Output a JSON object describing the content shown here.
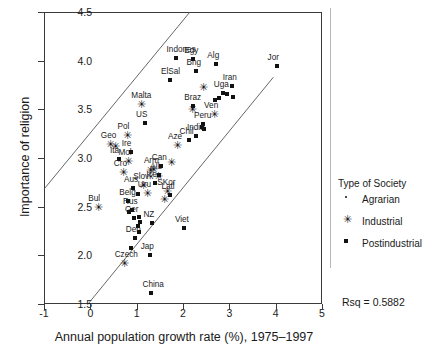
{
  "chart_data": {
    "type": "scatter",
    "title": "",
    "xlabel": "Annual population growth rate (%), 1975–1997",
    "ylabel": "Importance of religion",
    "xlim": [
      -1,
      5
    ],
    "ylim": [
      1.5,
      4.5
    ],
    "xticks": [
      "-1",
      "0",
      "1",
      "2",
      "3",
      "4",
      "5"
    ],
    "yticks": [
      "1.5",
      "2.0",
      "2.5",
      "3.0",
      "3.5",
      "4.0",
      "4.5"
    ],
    "grid": false,
    "annotation": "Rsq = 0.5882",
    "legend": {
      "title": "Type of Society",
      "position": "right",
      "entries": [
        {
          "label": "Agrarian",
          "marker": "dot"
        },
        {
          "label": "Industrial",
          "marker": "asterisk"
        },
        {
          "label": "Postindustrial",
          "marker": "square"
        }
      ]
    },
    "reference_lines": [
      {
        "name": "upper-band",
        "x0": -1,
        "y0": 2.68,
        "x1": 2.15,
        "y1": 4.5
      },
      {
        "name": "lower-band",
        "x0": -0.05,
        "y0": 1.5,
        "x1": 3.95,
        "y1": 3.83
      }
    ],
    "points": [
      {
        "label": "Indones",
        "x": 1.84,
        "y": 4.03,
        "marker": "square"
      },
      {
        "label": "Egy",
        "x": 2.22,
        "y": 4.02,
        "marker": "square"
      },
      {
        "label": "Alg",
        "x": 2.72,
        "y": 3.97,
        "marker": "square"
      },
      {
        "label": "Jor",
        "x": 4.02,
        "y": 3.95,
        "marker": "square"
      },
      {
        "label": "Bng",
        "x": 2.27,
        "y": 3.89,
        "marker": "square"
      },
      {
        "label": "ElSal",
        "x": 1.72,
        "y": 3.8,
        "marker": "square"
      },
      {
        "label": "Iran",
        "x": 3.05,
        "y": 3.74,
        "marker": "square"
      },
      {
        "label": "",
        "x": 2.42,
        "y": 3.73,
        "marker": "asterisk"
      },
      {
        "label": "Uga",
        "x": 2.86,
        "y": 3.67,
        "marker": "square"
      },
      {
        "label": "",
        "x": 2.96,
        "y": 3.66,
        "marker": "square"
      },
      {
        "label": "",
        "x": 3.08,
        "y": 3.63,
        "marker": "square"
      },
      {
        "label": "",
        "x": 2.77,
        "y": 3.62,
        "marker": "square"
      },
      {
        "label": "",
        "x": 2.7,
        "y": 3.6,
        "marker": "square"
      },
      {
        "label": "Malta",
        "x": 1.08,
        "y": 3.55,
        "marker": "asterisk"
      },
      {
        "label": "Braz",
        "x": 2.22,
        "y": 3.53,
        "marker": "square"
      },
      {
        "label": "",
        "x": 2.18,
        "y": 3.5,
        "marker": "asterisk"
      },
      {
        "label": "Ven",
        "x": 2.65,
        "y": 3.45,
        "marker": "asterisk"
      },
      {
        "label": "US",
        "x": 1.18,
        "y": 3.36,
        "marker": "square"
      },
      {
        "label": "Peru",
        "x": 2.43,
        "y": 3.35,
        "marker": "square"
      },
      {
        "label": "",
        "x": 2.4,
        "y": 3.32,
        "marker": "square"
      },
      {
        "label": "",
        "x": 2.46,
        "y": 3.3,
        "marker": "square"
      },
      {
        "label": "Pol",
        "x": 0.78,
        "y": 3.24,
        "marker": "asterisk"
      },
      {
        "label": "India",
        "x": 2.28,
        "y": 3.23,
        "marker": "square"
      },
      {
        "label": "Chil",
        "x": 2.12,
        "y": 3.19,
        "marker": "square"
      },
      {
        "label": "Geo",
        "x": 0.42,
        "y": 3.14,
        "marker": "asterisk"
      },
      {
        "label": "Aze",
        "x": 1.87,
        "y": 3.13,
        "marker": "asterisk"
      },
      {
        "label": "",
        "x": 0.52,
        "y": 3.12,
        "marker": "asterisk"
      },
      {
        "label": "Ire",
        "x": 0.87,
        "y": 3.06,
        "marker": "square"
      },
      {
        "label": "Ita",
        "x": 0.62,
        "y": 2.99,
        "marker": "square"
      },
      {
        "label": "Mol",
        "x": 0.8,
        "y": 2.97,
        "marker": "asterisk"
      },
      {
        "label": "",
        "x": 1.72,
        "y": 2.96,
        "marker": "asterisk"
      },
      {
        "label": "Can",
        "x": 1.52,
        "y": 2.92,
        "marker": "square"
      },
      {
        "label": "Arm",
        "x": 1.35,
        "y": 2.89,
        "marker": "asterisk"
      },
      {
        "label": "",
        "x": 1.28,
        "y": 2.88,
        "marker": "asterisk"
      },
      {
        "label": "Cro",
        "x": 0.7,
        "y": 2.86,
        "marker": "asterisk"
      },
      {
        "label": "Alb",
        "x": 1.49,
        "y": 2.83,
        "marker": "square"
      },
      {
        "label": "",
        "x": 1.44,
        "y": 2.81,
        "marker": "asterisk"
      },
      {
        "label": "Ice",
        "x": 1.4,
        "y": 2.74,
        "marker": "square"
      },
      {
        "label": "Slovk",
        "x": 1.12,
        "y": 2.72,
        "marker": "asterisk"
      },
      {
        "label": "Aus",
        "x": 0.92,
        "y": 2.69,
        "marker": "square"
      },
      {
        "label": "SKor",
        "x": 1.64,
        "y": 2.66,
        "marker": "asterisk"
      },
      {
        "label": "Uru",
        "x": 1.22,
        "y": 2.64,
        "marker": "asterisk"
      },
      {
        "label": "Latl",
        "x": 1.73,
        "y": 2.62,
        "marker": "square"
      },
      {
        "label": "",
        "x": 1.02,
        "y": 2.63,
        "marker": "square"
      },
      {
        "label": "",
        "x": 1.58,
        "y": 2.58,
        "marker": "asterisk"
      },
      {
        "label": "Belg",
        "x": 0.82,
        "y": 2.56,
        "marker": "square"
      },
      {
        "label": "Bul",
        "x": 0.15,
        "y": 2.5,
        "marker": "asterisk"
      },
      {
        "label": "Rus",
        "x": 0.9,
        "y": 2.47,
        "marker": "square"
      },
      {
        "label": "",
        "x": 0.84,
        "y": 2.45,
        "marker": "square"
      },
      {
        "label": "Ger",
        "x": 0.94,
        "y": 2.38,
        "marker": "square"
      },
      {
        "label": "",
        "x": 1.04,
        "y": 2.39,
        "marker": "square"
      },
      {
        "label": "",
        "x": 1.08,
        "y": 2.34,
        "marker": "square"
      },
      {
        "label": "NZ",
        "x": 1.34,
        "y": 2.33,
        "marker": "square"
      },
      {
        "label": "",
        "x": 1.02,
        "y": 2.3,
        "marker": "square"
      },
      {
        "label": "Viet",
        "x": 2.02,
        "y": 2.28,
        "marker": "square"
      },
      {
        "label": "",
        "x": 1.06,
        "y": 2.24,
        "marker": "square"
      },
      {
        "label": "Den",
        "x": 0.96,
        "y": 2.18,
        "marker": "square"
      },
      {
        "label": "",
        "x": 0.88,
        "y": 2.08,
        "marker": "square"
      },
      {
        "label": "Jap",
        "x": 1.28,
        "y": 2.0,
        "marker": "square"
      },
      {
        "label": "Czech",
        "x": 0.72,
        "y": 1.92,
        "marker": "asterisk"
      },
      {
        "label": "China",
        "x": 1.32,
        "y": 1.61,
        "marker": "square"
      }
    ]
  }
}
